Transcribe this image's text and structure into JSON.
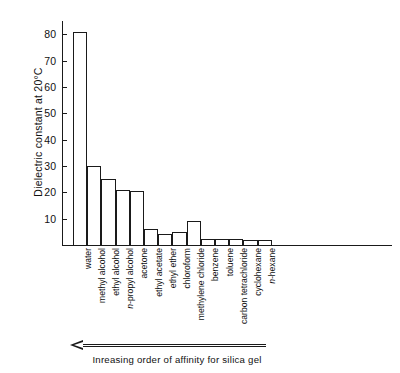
{
  "chart_data": {
    "type": "bar",
    "title": "",
    "xlabel": "Inreasing order of affinity for silica gel",
    "ylabel": "Dielectric constant at 20°C",
    "ylim": [
      0,
      85
    ],
    "grid": false,
    "legend": "none",
    "ytick_labels": [
      "10",
      "20",
      "30",
      "40",
      "50",
      "60",
      "70",
      "80"
    ],
    "ytick_values": [
      10,
      20,
      30,
      40,
      50,
      60,
      70,
      80
    ],
    "categories": [
      "water",
      "methyl alcohol",
      "ethyl alcohol",
      "n-propyl alcohol",
      "acetone",
      "ethyl acetate",
      "ethyl ether",
      "chloroform",
      "methylene chloride",
      "benzene",
      "toluene",
      "carbon tetrachloride",
      "cyclohexane",
      "n-hexane"
    ],
    "categories_italic_prefix": [
      "",
      "",
      "",
      "n-",
      "",
      "",
      "",
      "",
      "",
      "",
      "",
      "",
      "",
      "n-"
    ],
    "values": [
      81,
      30,
      25,
      21,
      20.5,
      6,
      4.3,
      4.8,
      9,
      2.3,
      2.4,
      2.2,
      2,
      1.9
    ],
    "bar_fill": "#ffffff",
    "bar_edge": "#1a1a1a",
    "annotations": [
      {
        "name": "affinity-arrow",
        "text": "Inreasing order of affinity for silica gel",
        "direction": "left"
      }
    ]
  },
  "axis": {
    "y_title": "Dielectric constant at 20°C"
  },
  "caption": {
    "text": "Inreasing order of affinity for silica gel"
  }
}
